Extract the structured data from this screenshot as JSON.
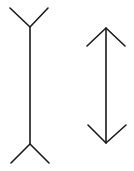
{
  "diagram": {
    "name": "Muller-Lyer illusion",
    "stroke_color": "#1a1a1a",
    "background": "#ffffff",
    "figures": [
      {
        "id": "fins-out",
        "shaft": {
          "x": 30,
          "y1": 27,
          "y2": 144
        },
        "top_fins": [
          [
            10,
            8
          ],
          [
            30,
            27
          ],
          [
            48,
            8
          ]
        ],
        "bottom_fins": [
          [
            11,
            163
          ],
          [
            30,
            144
          ],
          [
            49,
            163
          ]
        ]
      },
      {
        "id": "fins-in",
        "shaft": {
          "x": 106,
          "y1": 28,
          "y2": 143
        },
        "top_fins": [
          [
            87,
            46
          ],
          [
            106,
            28
          ],
          [
            125,
            46
          ]
        ],
        "bottom_fins": [
          [
            88,
            125
          ],
          [
            106,
            143
          ],
          [
            126,
            125
          ]
        ]
      }
    ]
  }
}
